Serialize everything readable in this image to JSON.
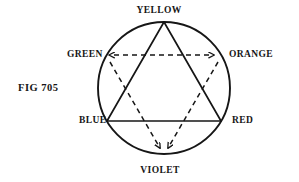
{
  "figure": {
    "caption": "FIG 705",
    "type": "color-wheel-diagram",
    "labels": {
      "yellow": "YELLOW",
      "orange": "ORANGE",
      "red": "RED",
      "violet": "VIOLET",
      "blue": "BLUE",
      "green": "GREEN"
    },
    "geometry": {
      "center_x": 164,
      "center_y": 88,
      "radius": 66,
      "stroke_color": "#161616",
      "background_color": "#ffffff",
      "circle_stroke_width": 1.9,
      "solid_triangle_stroke_width": 1.7,
      "dashed_triangle_stroke_width": 1.5,
      "dash_pattern": "5,4"
    },
    "vertices": [
      {
        "name": "YELLOW",
        "angle_deg": 90,
        "x": 164,
        "y": 22,
        "triangle": "primary"
      },
      {
        "name": "ORANGE",
        "angle_deg": 30,
        "x": 221,
        "y": 55,
        "triangle": "secondary"
      },
      {
        "name": "RED",
        "angle_deg": 330,
        "x": 221,
        "y": 121,
        "triangle": "primary"
      },
      {
        "name": "VIOLET",
        "angle_deg": 270,
        "x": 164,
        "y": 154,
        "triangle": "secondary"
      },
      {
        "name": "BLUE",
        "angle_deg": 210,
        "x": 107,
        "y": 121,
        "triangle": "primary"
      },
      {
        "name": "GREEN",
        "angle_deg": 150,
        "x": 107,
        "y": 55,
        "triangle": "secondary"
      }
    ],
    "triangles": [
      {
        "id": "primary-triangle",
        "style": "solid",
        "vertices": [
          "YELLOW",
          "BLUE",
          "RED"
        ],
        "arrowheads": false
      },
      {
        "id": "secondary-triangle",
        "style": "dashed",
        "vertices": [
          "GREEN",
          "ORANGE",
          "VIOLET"
        ],
        "arrowheads": true
      }
    ]
  }
}
